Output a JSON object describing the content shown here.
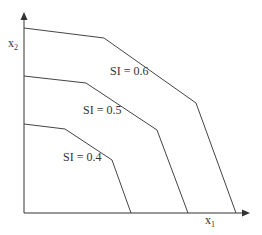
{
  "axes": {
    "x_label": "x",
    "x_sub": "1",
    "y_label": "x",
    "y_sub": "2",
    "color": "#333333"
  },
  "curves": [
    {
      "label": "SI = 0.6",
      "points": "24,28 104,38 196,103 236,213"
    },
    {
      "label": "SI = 0.5",
      "points": "24,76 86,83 157,130 188,213"
    },
    {
      "label": "SI = 0.4",
      "points": "24,124 65,129 112,160 131,213"
    }
  ],
  "chart_data": {
    "type": "line",
    "title": "",
    "xlabel": "x1",
    "ylabel": "x2",
    "series": [
      {
        "name": "SI = 0.6",
        "x": [
          0,
          0.35,
          0.76,
          0.94
        ],
        "y": [
          1.0,
          0.95,
          0.6,
          0.0
        ]
      },
      {
        "name": "SI = 0.5",
        "x": [
          0,
          0.27,
          0.59,
          0.73
        ],
        "y": [
          0.74,
          0.7,
          0.45,
          0.0
        ]
      },
      {
        "name": "SI = 0.4",
        "x": [
          0,
          0.18,
          0.39,
          0.48
        ],
        "y": [
          0.48,
          0.45,
          0.29,
          0.0
        ]
      }
    ],
    "grid": false,
    "legend": "inline labels"
  }
}
